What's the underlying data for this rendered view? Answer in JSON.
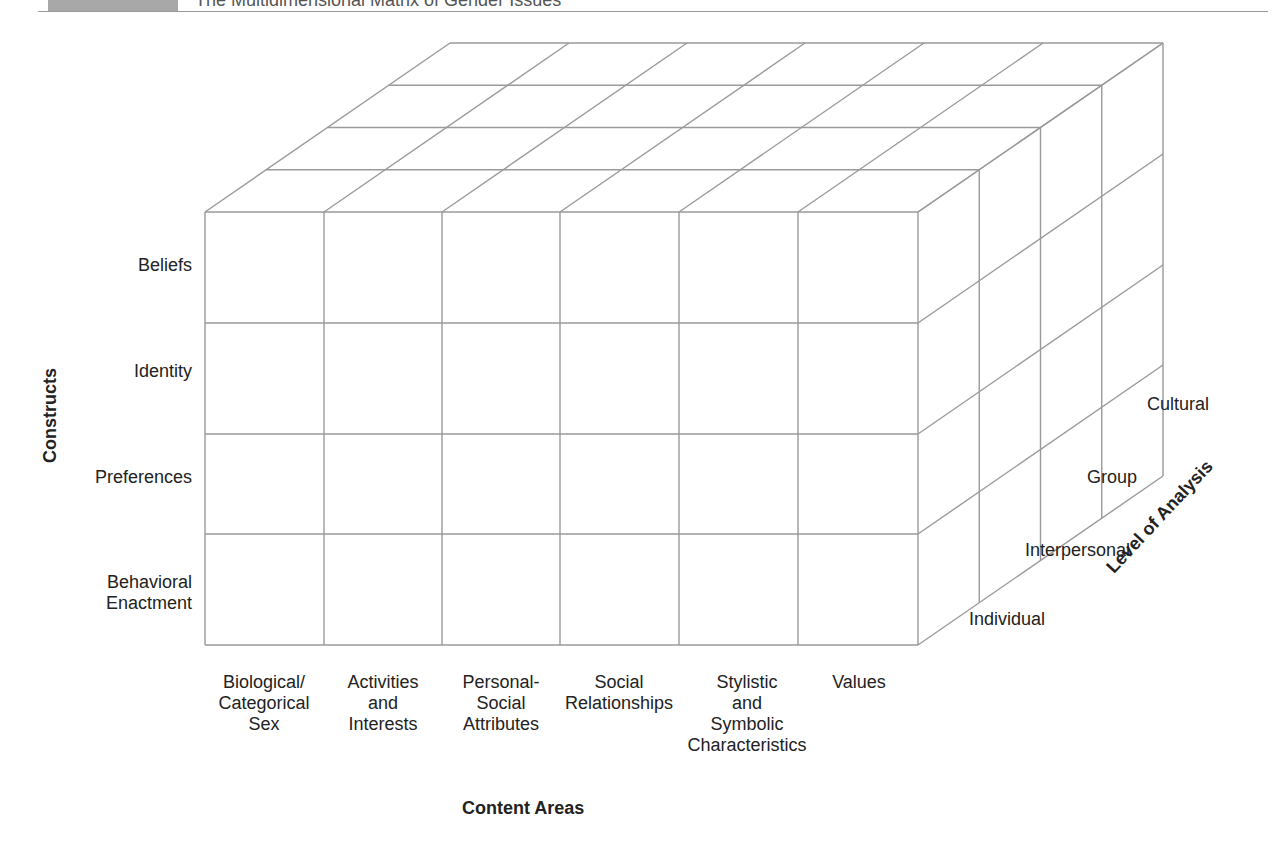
{
  "header": {
    "figure_label": "",
    "title": "The Multidimensional Matrix of Gender Issues"
  },
  "axes": {
    "constructs": "Constructs",
    "content_areas": "Content Areas",
    "level_of_analysis": "Level of Analysis"
  },
  "rows": [
    {
      "label": "Beliefs"
    },
    {
      "label": "Identity"
    },
    {
      "label": "Preferences"
    },
    {
      "label": "Behavioral\nEnactment"
    }
  ],
  "columns": [
    {
      "label": "Biological/\nCategorical\nSex"
    },
    {
      "label": "Activities\nand\nInterests"
    },
    {
      "label": "Personal-\nSocial\nAttributes"
    },
    {
      "label": "Social\nRelationships"
    },
    {
      "label": "Stylistic\nand\nSymbolic\nCharacteristics"
    },
    {
      "label": "Values"
    }
  ],
  "levels": [
    {
      "label": "Individual"
    },
    {
      "label": "Interpersonal"
    },
    {
      "label": "Group"
    },
    {
      "label": "Cultural"
    }
  ],
  "colors": {
    "grid_line": "#9a9a9a",
    "text": "#222222",
    "header_band": "#a8a8a8"
  }
}
